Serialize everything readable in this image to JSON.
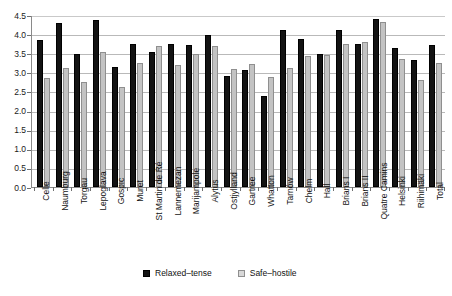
{
  "chart_data": {
    "type": "bar",
    "title": "",
    "xlabel": "",
    "ylabel": "",
    "ylim": [
      0,
      4.5
    ],
    "yticks": [
      "0.0",
      "0.5",
      "1.0",
      "1.5",
      "2.0",
      "2.5",
      "3.0",
      "3.5",
      "4.0",
      "4.5"
    ],
    "grid": true,
    "legend_position": "bottom",
    "categories": [
      "Celle",
      "Naumburg",
      "Torgau",
      "Lepoglava",
      "Gospic",
      "Muret",
      "St Martin de Ré",
      "Lannemezan",
      "Marijampole",
      "Alytus",
      "Ostjylland",
      "Gartree",
      "Whatton",
      "Tarnów",
      "Chelm",
      "Hall",
      "Brians I",
      "Brians II",
      "Quatre Camins",
      "Helsinki",
      "Riihimäki",
      "Total"
    ],
    "series": [
      {
        "name": "Relaxed–tense",
        "color": "#131313",
        "values": [
          3.85,
          4.28,
          3.47,
          4.38,
          3.13,
          3.75,
          3.54,
          3.75,
          3.72,
          3.97,
          2.91,
          3.07,
          2.38,
          4.11,
          3.88,
          3.47,
          4.12,
          3.75,
          4.39,
          3.64,
          3.33,
          3.72
        ]
      },
      {
        "name": "Safe–hostile",
        "color": "#c3c3c3",
        "values": [
          2.84,
          3.12,
          2.76,
          3.53,
          2.61,
          3.25,
          3.68,
          3.2,
          3.48,
          3.7,
          3.08,
          3.23,
          2.88,
          3.12,
          3.43,
          3.46,
          3.73,
          3.8,
          4.32,
          3.34,
          2.8,
          3.25
        ]
      }
    ]
  },
  "legend": {
    "items": [
      {
        "label": "Relaxed–tense"
      },
      {
        "label": "Safe–hostile"
      }
    ]
  }
}
